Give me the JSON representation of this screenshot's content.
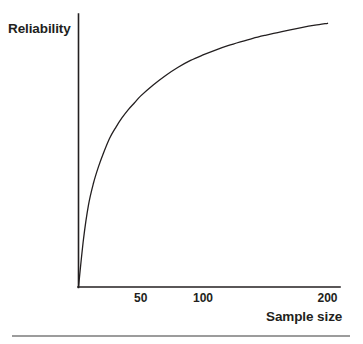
{
  "figure": {
    "background_color": "#ffffff",
    "ink_color": "#231f20",
    "bottom_rule": {
      "visible": true,
      "x_start": 12,
      "x_end": 350,
      "y": 336
    }
  },
  "chart_data": {
    "type": "line",
    "title": "",
    "xlabel": "Sample size",
    "ylabel": "Reliability",
    "grid": false,
    "legend": null,
    "xlim": [
      0,
      210
    ],
    "ylim": [
      0,
      1
    ],
    "xticks": [
      50,
      100,
      200
    ],
    "xtick_labels": [
      "50",
      "100",
      "200"
    ],
    "yticks": [],
    "ytick_labels": [],
    "axis_style": {
      "spines": [
        "left",
        "bottom"
      ],
      "tick_marks": false,
      "line_width_px": 1.6,
      "color": "#231f20"
    },
    "series": [
      {
        "name": "Reliability",
        "color": "#231f20",
        "line_width_px": 1.3,
        "x": [
          0,
          4,
          8,
          12,
          16,
          20,
          25,
          30,
          35,
          40,
          45,
          50,
          60,
          70,
          80,
          90,
          100,
          110,
          120,
          130,
          140,
          150,
          160,
          170,
          180,
          190,
          200
        ],
        "y": [
          0.0,
          0.175,
          0.3,
          0.38,
          0.44,
          0.49,
          0.545,
          0.585,
          0.62,
          0.65,
          0.675,
          0.7,
          0.74,
          0.775,
          0.805,
          0.83,
          0.85,
          0.868,
          0.884,
          0.898,
          0.911,
          0.922,
          0.932,
          0.942,
          0.951,
          0.959,
          0.966
        ]
      }
    ],
    "annotations": []
  }
}
